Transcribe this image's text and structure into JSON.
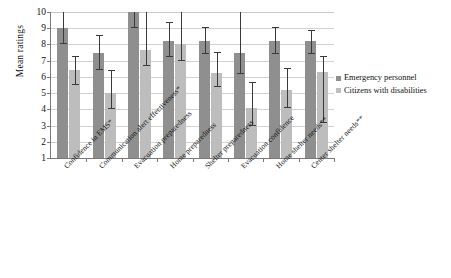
{
  "chart_data": {
    "type": "bar",
    "title": "",
    "xlabel": "",
    "ylabel": "Mean ratings",
    "ylim": [
      1,
      10
    ],
    "yticks": [
      10,
      9,
      8,
      7,
      6,
      5,
      4,
      3,
      2,
      1
    ],
    "grid": true,
    "legend_position": "right",
    "categories": [
      "Confidence in EMS*",
      "Communication alert effectiveness*",
      "Evacuation preparedness",
      "Home preparedness",
      "Shelter preparedness",
      "Evacuation confidence",
      "Home shelter needs**",
      "Center shelter needs**"
    ],
    "series": [
      {
        "name": "Emergency personnel",
        "color": "#8f8f8f",
        "values": [
          9.0,
          7.45,
          10.0,
          8.2,
          8.2,
          7.5,
          8.2,
          8.2
        ],
        "error_low": [
          8.0,
          6.45,
          9.0,
          7.2,
          7.4,
          6.2,
          7.4,
          7.4
        ],
        "error_high": [
          10.0,
          8.5,
          10.4,
          9.3,
          9.0,
          10.0,
          9.0,
          8.8
        ]
      },
      {
        "name": "Citizens with disabilities",
        "color": "#bdbdbd",
        "values": [
          6.45,
          5.0,
          7.65,
          8.0,
          6.25,
          4.1,
          5.2,
          6.3
        ],
        "error_low": [
          5.5,
          4.0,
          6.7,
          7.0,
          5.35,
          2.95,
          4.1,
          3.15
        ],
        "error_high": [
          7.2,
          6.35,
          10.0,
          10.0,
          7.45,
          5.6,
          6.5,
          7.2
        ]
      }
    ]
  },
  "legend": {
    "items": [
      {
        "label": "Emergency personnel",
        "color": "#8f8f8f"
      },
      {
        "label": "Citizens with disabilities",
        "color": "#bdbdbd"
      }
    ]
  },
  "axis": {
    "y_title": "Mean ratings"
  }
}
